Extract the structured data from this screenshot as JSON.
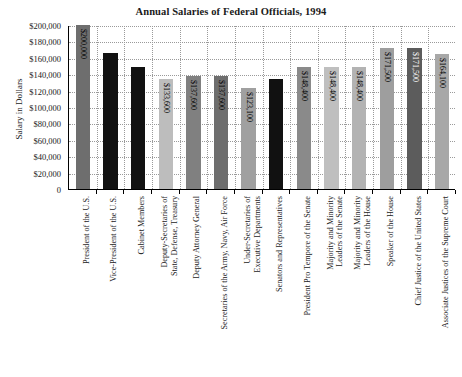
{
  "chart_data": {
    "type": "bar",
    "title": "Annual Salaries of Federal Officials, 1994",
    "xlabel": "",
    "ylabel": "Salary in Dollars",
    "ylim": [
      0,
      200000
    ],
    "ytick_step": 20000,
    "grid": true,
    "legend": "none",
    "ytick_labels": [
      "$200,000",
      "$180,000",
      "$160,000",
      "$140,000",
      "$120,000",
      "$100,000",
      "$80,000",
      "$60,000",
      "$40,000",
      "$20,000",
      "0"
    ],
    "ytick_values": [
      200000,
      180000,
      160000,
      140000,
      120000,
      100000,
      80000,
      60000,
      40000,
      20000,
      0
    ],
    "categories": [
      "President of the U.S.",
      "Vice-President of the U.S.",
      "Cabinet Members",
      "Deputy-Secretaries of\nState, Defense, Treasury",
      "Deputy Attorney General",
      "Secretaries of the Army, Navy, Air Force",
      "Under-Secretaries of\nExecutive Departments",
      "Senators and Representatives",
      "President Pro Tempore of the Senate",
      "Majority and Minority\nLeaders of the Senate",
      "Majority and Minority\nLeaders of the House",
      "Speaker of the House",
      "Chief Justice of the United States",
      "Associate Justices of the Supreme Court"
    ],
    "values": [
      200000,
      166200,
      148400,
      133600,
      137600,
      137600,
      123100,
      133600,
      148400,
      148400,
      148400,
      171500,
      171500,
      164100
    ],
    "bar_labels": [
      "$200,000",
      "",
      "",
      "$133,600",
      "$137,600",
      "$137,600",
      "$123,100",
      "",
      "$148,400",
      "$148,400",
      "$148,400",
      "$171,500",
      "$171,500",
      "$164,100"
    ],
    "bar_colors": [
      "#6e6e6e",
      "#111111",
      "#111111",
      "#bdbdbd",
      "#808080",
      "#6e6e6e",
      "#a0a0a0",
      "#111111",
      "#8a8a8a",
      "#bfbfbf",
      "#b3b3b3",
      "#9e9e9e",
      "#5c5c5c",
      "#a8a8a8"
    ],
    "bar_label_colors": [
      "dark",
      "light",
      "light",
      "dark",
      "dark",
      "dark",
      "dark",
      "light",
      "dark",
      "dark",
      "dark",
      "dark",
      "light",
      "dark"
    ]
  }
}
